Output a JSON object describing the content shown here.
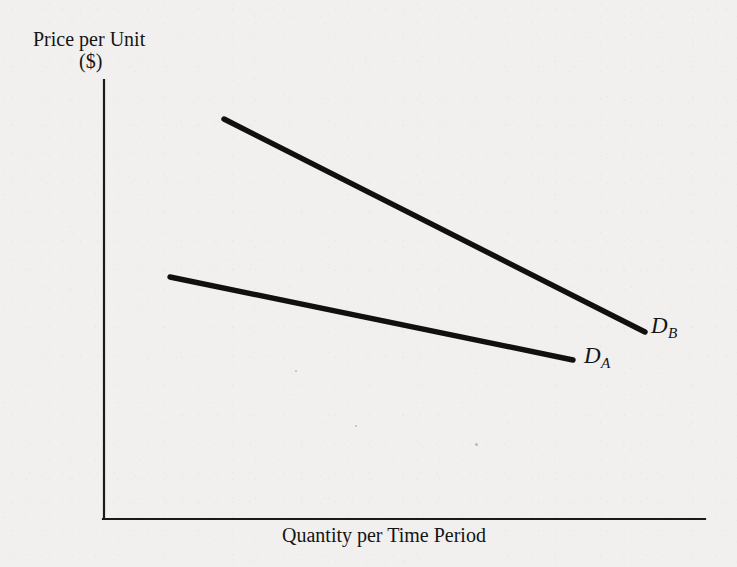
{
  "figure": {
    "y_axis_title": "Price per Unit",
    "y_axis_units": "($)",
    "x_axis_title": "Quantity per Time Period",
    "curve_label_a": "D",
    "curve_label_a_sub": "A",
    "curve_label_b": "D",
    "curve_label_b_sub": "B",
    "line_color": "#101010",
    "axis_color": "#1a1a1a",
    "background_color": "#f1f0ee"
  },
  "chart_data": {
    "type": "line",
    "title": "",
    "xlabel": "Quantity per Time Period",
    "ylabel": "Price per Unit ($)",
    "grid": false,
    "legend": "inline-end-labels",
    "axes": {
      "x_origin_px": 104,
      "y_origin_px": 519,
      "x_end_px": 705,
      "y_top_px": 80,
      "ticks": [],
      "tick_labels": []
    },
    "series": [
      {
        "name": "D",
        "subscript": "A",
        "description": "Flatter (more elastic) demand curve",
        "points_px": [
          [
            170,
            277
          ],
          [
            573,
            360
          ]
        ],
        "slope_px_per_px": -0.206,
        "label_position": "right-end"
      },
      {
        "name": "D",
        "subscript": "B",
        "description": "Steeper (less elastic) demand curve",
        "points_px": [
          [
            224,
            119
          ],
          [
            645,
            332
          ]
        ],
        "slope_px_per_px": -0.506,
        "label_position": "right-end"
      }
    ]
  }
}
